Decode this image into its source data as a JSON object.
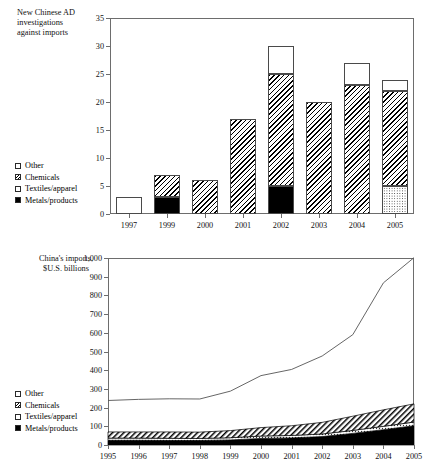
{
  "figure": {
    "legend_items": [
      {
        "key": "other",
        "label": "Other",
        "pattern": "white-open-square"
      },
      {
        "key": "chemicals",
        "label": "Chemicals",
        "pattern": "diagonal-hatch"
      },
      {
        "key": "textiles",
        "label": "Textiles/apparel",
        "pattern": "dotted"
      },
      {
        "key": "metals",
        "label": "Metals/products",
        "pattern": "solid-black"
      }
    ]
  },
  "chart_data": [
    {
      "type": "bar",
      "id": "ad-investigations",
      "title": "New Chinese AD\ninvestigations\nagainst imports",
      "stacked": true,
      "xlabel": "",
      "ylabel": "",
      "ylim": [
        0,
        35
      ],
      "yticks": [
        "0",
        "5",
        "10",
        "15",
        "20",
        "25",
        "30",
        "35"
      ],
      "ytick_values": [
        0,
        5,
        10,
        15,
        20,
        25,
        30,
        35
      ],
      "grid": false,
      "legend_position": "left-lower",
      "categories": [
        "1997",
        "1999",
        "2000",
        "2001",
        "2002",
        "2003",
        "2004",
        "2005"
      ],
      "series": [
        {
          "name": "Metals/products",
          "pattern": "solid-black",
          "values": [
            0,
            3,
            0,
            0,
            5,
            0,
            0,
            0
          ]
        },
        {
          "name": "Textiles/apparel",
          "pattern": "dotted",
          "values": [
            0,
            0,
            0,
            0,
            0,
            0,
            0,
            5
          ]
        },
        {
          "name": "Chemicals",
          "pattern": "diagonal-hatch",
          "values": [
            0,
            4,
            6,
            17,
            20,
            20,
            23,
            17
          ]
        },
        {
          "name": "Other",
          "pattern": "white-open-square",
          "values": [
            3,
            0,
            0,
            0,
            5,
            0,
            4,
            2
          ]
        }
      ],
      "totals": [
        3,
        7,
        6,
        17,
        30,
        20,
        27,
        24
      ]
    },
    {
      "type": "area",
      "id": "china-imports",
      "title": "China's imports,\n$U.S. billions",
      "stacked": true,
      "xlabel": "",
      "ylabel": "",
      "ylim": [
        0,
        1000
      ],
      "yticks": [
        "0",
        "100",
        "200",
        "300",
        "400",
        "500",
        "600",
        "700",
        "800",
        "900",
        "1,000"
      ],
      "ytick_values": [
        0,
        100,
        200,
        300,
        400,
        500,
        600,
        700,
        800,
        900,
        1000
      ],
      "grid": false,
      "legend_position": "left-lower",
      "x": [
        "1995",
        "1996",
        "1997",
        "1998",
        "1999",
        "2000",
        "2001",
        "2002",
        "2003",
        "2004",
        "2005"
      ],
      "series": [
        {
          "name": "Metals/products",
          "pattern": "solid-black",
          "values": [
            25,
            25,
            24,
            24,
            27,
            35,
            38,
            45,
            62,
            82,
            103
          ]
        },
        {
          "name": "Textiles/apparel",
          "pattern": "dotted",
          "values": [
            12,
            12,
            12,
            11,
            12,
            13,
            13,
            14,
            16,
            18,
            20
          ]
        },
        {
          "name": "Chemicals",
          "pattern": "diagonal-hatch",
          "values": [
            33,
            33,
            34,
            34,
            38,
            45,
            52,
            62,
            76,
            88,
            97
          ]
        },
        {
          "name": "Total imports (line)",
          "pattern": "line",
          "values": [
            238,
            244,
            247,
            246,
            288,
            371,
            404,
            476,
            590,
            867,
            1002
          ]
        }
      ]
    }
  ]
}
